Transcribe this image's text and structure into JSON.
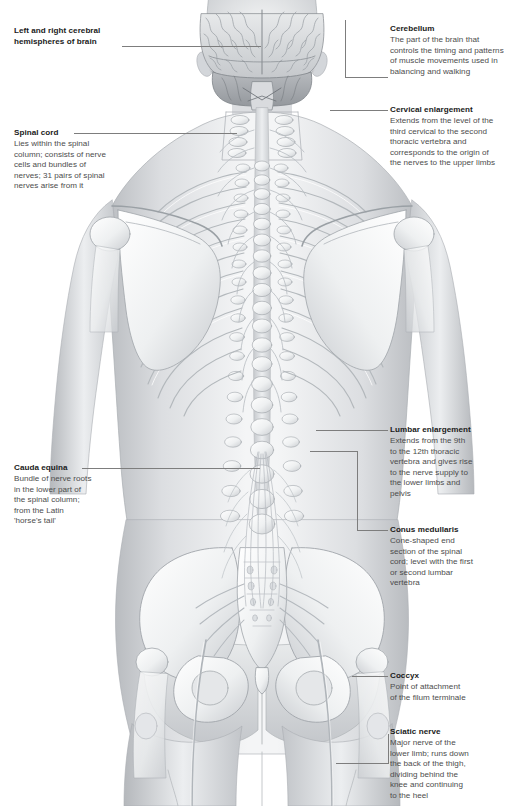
{
  "document": {
    "subject": "Human spinal cord and nervous system, posterior view",
    "view": "posterior",
    "background_color": "#ffffff",
    "leader_color": "#7d7d7d",
    "title_color": "#1a1a1a",
    "body_color": "#4c4c4c"
  },
  "callouts": [
    {
      "id": "cerebral-hemispheres",
      "side": "left",
      "title": "Left and right cerebral hemispheres of brain",
      "title_lines": [
        "Left and right cerebral",
        "hemispheres of brain"
      ],
      "body_lines": []
    },
    {
      "id": "spinal-cord",
      "side": "left",
      "title": "Spinal cord",
      "body_lines": [
        "Lies within the spinal",
        "column; consists of nerve",
        "cells and bundles of",
        "nerves; 31 pairs of spinal",
        "nerves arise from it"
      ]
    },
    {
      "id": "cauda-equina",
      "side": "left",
      "title": "Cauda equina",
      "body_lines": [
        "Bundle of nerve roots",
        "in the lower part of",
        "the spinal column;",
        "from the Latin",
        "'horse's tail'"
      ]
    },
    {
      "id": "cerebellum",
      "side": "right",
      "title": "Cerebellum",
      "body_lines": [
        "The part of the brain that",
        "controls the timing and patterns",
        "of muscle movements used in",
        "balancing and walking"
      ]
    },
    {
      "id": "cervical-enlargement",
      "side": "right",
      "title": "Cervical enlargement",
      "body_lines": [
        "Extends from the level of the",
        "third cervical to the second",
        "thoracic vertebra and",
        "corresponds to the origin of",
        "the nerves to the upper limbs"
      ]
    },
    {
      "id": "lumbar-enlargement",
      "side": "right",
      "title": "Lumbar enlargement",
      "body_lines": [
        "Extends from the 9th",
        "to the 12th thoracic",
        "vertebra and gives rise",
        "to the nerve supply to",
        "the lower limbs and",
        "pelvis"
      ]
    },
    {
      "id": "conus-medullaris",
      "side": "right",
      "title": "Conus medullaris",
      "body_lines": [
        "Cone-shaped end",
        "section of the spinal",
        "cord; level with the first",
        "or second lumbar",
        "vertebra"
      ]
    },
    {
      "id": "coccyx",
      "side": "right",
      "title": "Coccyx",
      "body_lines": [
        "Point of attachment",
        "of the filum terminale"
      ]
    },
    {
      "id": "sciatic-nerve",
      "side": "right",
      "title": "Sciatic nerve",
      "body_lines": [
        "Major nerve of the",
        "lower limb; runs down",
        "the back of the thigh,",
        "dividing behind the",
        "knee and continuing",
        "to the heel"
      ]
    }
  ]
}
